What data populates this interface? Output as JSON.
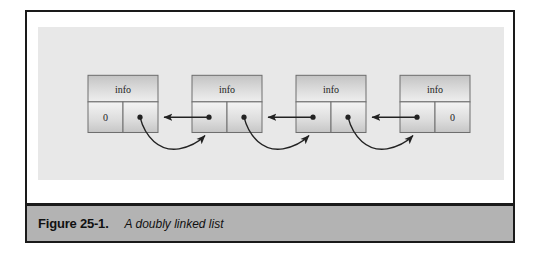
{
  "figure": {
    "caption_number": "Figure 25-1.",
    "caption_text": "A doubly linked list",
    "background_color": "#ffffff",
    "panel_color": "#e8e8e8",
    "caption_bar_color": "#b3b3b3",
    "frame_color": "#1a1a1a"
  },
  "diagram": {
    "type": "doubly-linked-list",
    "node_count": 4,
    "nodes": [
      {
        "index": 0,
        "info_label": "info",
        "left_cell": "0",
        "right_cell": "",
        "left_is_null": true,
        "right_is_null": false
      },
      {
        "index": 1,
        "info_label": "info",
        "left_cell": "",
        "right_cell": "",
        "left_is_null": false,
        "right_is_null": false
      },
      {
        "index": 2,
        "info_label": "info",
        "left_cell": "",
        "right_cell": "",
        "left_is_null": false,
        "right_is_null": false
      },
      {
        "index": 3,
        "info_label": "info",
        "left_cell": "",
        "right_cell": "0",
        "left_is_null": false,
        "right_is_null": true
      }
    ],
    "links": [
      {
        "from_node": 0,
        "to_node": 1,
        "kind": "next",
        "style": "curved"
      },
      {
        "from_node": 1,
        "to_node": 0,
        "kind": "prev",
        "style": "straight"
      },
      {
        "from_node": 1,
        "to_node": 2,
        "kind": "next",
        "style": "curved"
      },
      {
        "from_node": 2,
        "to_node": 1,
        "kind": "prev",
        "style": "straight"
      },
      {
        "from_node": 2,
        "to_node": 3,
        "kind": "next",
        "style": "curved"
      },
      {
        "from_node": 3,
        "to_node": 2,
        "kind": "prev",
        "style": "straight"
      }
    ],
    "arrow_color": "#222222",
    "node_border_color": "#6e6e6e"
  }
}
